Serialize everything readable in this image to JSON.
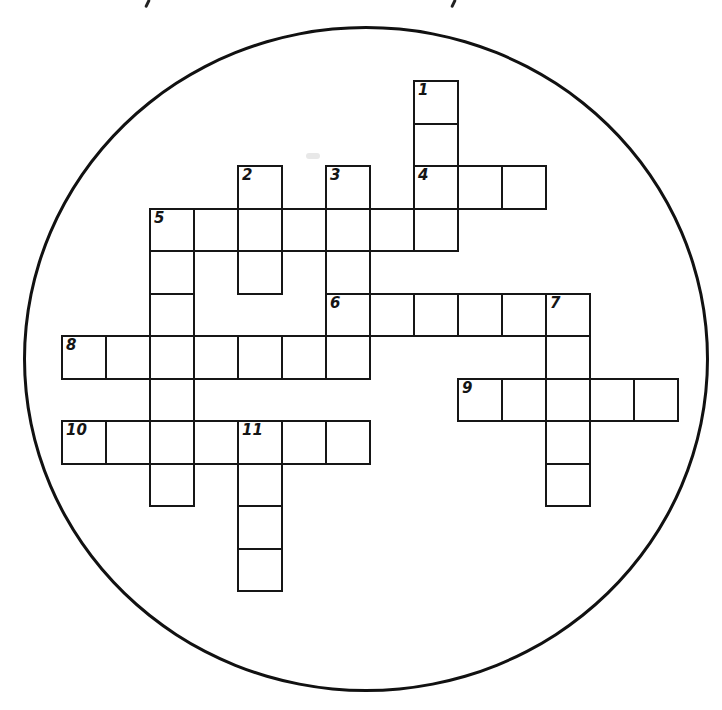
{
  "puzzle": {
    "type": "crossword",
    "shape": "circle",
    "frame": {
      "cx": 366,
      "cy": 359,
      "rx": 343,
      "ry": 333,
      "stroke": "#111111"
    },
    "grid": {
      "origin_x": 61,
      "origin_y": 80,
      "cell_w": 44,
      "cell_h": 42.5
    },
    "clue_numbers": [
      "1",
      "2",
      "3",
      "4",
      "5",
      "6",
      "7",
      "8",
      "9",
      "10",
      "11"
    ],
    "entries": [
      {
        "number": "1",
        "direction": "down",
        "col": 8,
        "row": 0,
        "length": 4
      },
      {
        "number": "2",
        "direction": "down",
        "col": 4,
        "row": 2,
        "length": 3
      },
      {
        "number": "3",
        "direction": "down",
        "col": 6,
        "row": 2,
        "length": 5
      },
      {
        "number": "4",
        "direction": "across",
        "col": 8,
        "row": 2,
        "length": 3
      },
      {
        "number": "5",
        "direction": "across",
        "col": 2,
        "row": 3,
        "length": 7
      },
      {
        "number": "5",
        "direction": "down",
        "col": 2,
        "row": 3,
        "length": 7
      },
      {
        "number": "6",
        "direction": "across",
        "col": 6,
        "row": 5,
        "length": 6
      },
      {
        "number": "7",
        "direction": "down",
        "col": 11,
        "row": 5,
        "length": 5
      },
      {
        "number": "8",
        "direction": "across",
        "col": 0,
        "row": 6,
        "length": 7
      },
      {
        "number": "9",
        "direction": "across",
        "col": 9,
        "row": 7,
        "length": 5
      },
      {
        "number": "10",
        "direction": "across",
        "col": 0,
        "row": 8,
        "length": 7
      },
      {
        "number": "11",
        "direction": "down",
        "col": 4,
        "row": 8,
        "length": 4
      }
    ],
    "labels": [
      {
        "text": "1",
        "col": 8,
        "row": 0
      },
      {
        "text": "2",
        "col": 4,
        "row": 2
      },
      {
        "text": "3",
        "col": 6,
        "row": 2
      },
      {
        "text": "4",
        "col": 8,
        "row": 2
      },
      {
        "text": "5",
        "col": 2,
        "row": 3
      },
      {
        "text": "6",
        "col": 6,
        "row": 5
      },
      {
        "text": "7",
        "col": 11,
        "row": 5
      },
      {
        "text": "8",
        "col": 0,
        "row": 6
      },
      {
        "text": "9",
        "col": 9,
        "row": 7
      },
      {
        "text": "10",
        "col": 0,
        "row": 8
      },
      {
        "text": "11",
        "col": 4,
        "row": 8
      }
    ]
  }
}
